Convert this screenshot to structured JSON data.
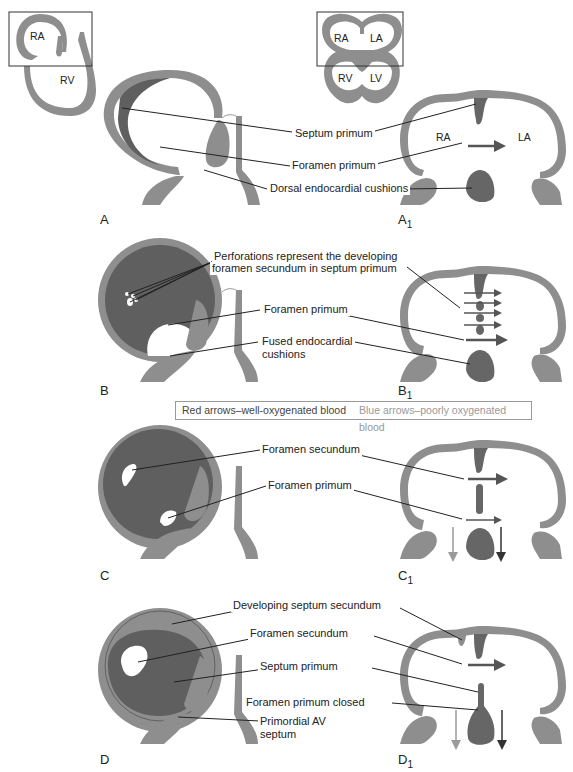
{
  "figure": {
    "panels": [
      {
        "id": "A",
        "label": "A"
      },
      {
        "id": "A1",
        "label": "A",
        "sub": "1"
      },
      {
        "id": "B",
        "label": "B"
      },
      {
        "id": "B1",
        "label": "B",
        "sub": "1"
      },
      {
        "id": "C",
        "label": "C"
      },
      {
        "id": "C1",
        "label": "C",
        "sub": "1"
      },
      {
        "id": "D",
        "label": "D"
      },
      {
        "id": "D1",
        "label": "D",
        "sub": "1"
      }
    ],
    "chambers": {
      "ra": "RA",
      "rv": "RV",
      "la": "LA",
      "lv": "LV"
    },
    "labels_a": {
      "septum_primum": "Septum primum",
      "foramen_primum": "Foramen primum",
      "dorsal_cushions": "Dorsal endocardial cushions"
    },
    "labels_b": {
      "perforations_1": "Perforations represent the developing",
      "perforations_2": "foramen secundum in septum primum",
      "foramen_primum": "Foramen primum",
      "fused_1": "Fused endocardial",
      "fused_2": "cushions"
    },
    "legend": {
      "red": "Red arrows–well-oxygenated blood",
      "blue": "Blue arrows–poorly oxygenated blood"
    },
    "labels_c": {
      "foramen_secundum": "Foramen secundum",
      "foramen_primum": "Foramen primum"
    },
    "labels_d": {
      "developing_septum_secundum": "Developing septum secundum",
      "foramen_secundum": "Foramen secundum",
      "septum_primum": "Septum primum",
      "foramen_primum_closed": "Foramen primum closed",
      "primordial_av_1": "Primordial AV",
      "primordial_av_2": "septum"
    },
    "colors": {
      "wall": "#8e8e8e",
      "septum": "#666666",
      "line": "#222222",
      "arrow_red": "#555555",
      "arrow_blue": "#9a9a9a",
      "legend_border": "#999999"
    }
  }
}
